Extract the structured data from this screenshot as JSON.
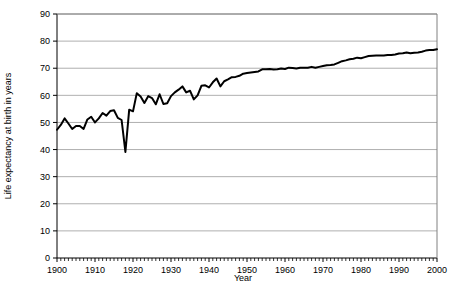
{
  "chart_data": {
    "type": "line",
    "title": "",
    "subtitle": "",
    "xlabel": "Year",
    "ylabel": "Life expectancy at birth in years",
    "xlim": [
      1900,
      2000
    ],
    "ylim": [
      0,
      90
    ],
    "ytick_labels": [
      "0",
      "10",
      "20",
      "30",
      "40",
      "50",
      "60",
      "70",
      "80",
      "90"
    ],
    "yticks": [
      0,
      10,
      20,
      30,
      40,
      50,
      60,
      70,
      80,
      90
    ],
    "xtick_labels": [
      "1900",
      "1910",
      "1920",
      "1930",
      "1940",
      "1950",
      "1960",
      "1970",
      "1980",
      "1990",
      "2000"
    ],
    "xticks": [
      1900,
      1910,
      1920,
      1930,
      1940,
      1950,
      1960,
      1970,
      1980,
      1990,
      2000
    ],
    "minor_xtick_interval": 1,
    "grid": "horizontal",
    "grid_color": "#9a9a9a",
    "legend": "none",
    "line_color": "#000000",
    "line_width": 2,
    "plot_border_color": "#808080",
    "background_color": "#ffffff",
    "x": [
      1900,
      1901,
      1902,
      1903,
      1904,
      1905,
      1906,
      1907,
      1908,
      1909,
      1910,
      1911,
      1912,
      1913,
      1914,
      1915,
      1916,
      1917,
      1918,
      1919,
      1920,
      1921,
      1922,
      1923,
      1924,
      1925,
      1926,
      1927,
      1928,
      1929,
      1930,
      1931,
      1932,
      1933,
      1934,
      1935,
      1936,
      1937,
      1938,
      1939,
      1940,
      1941,
      1942,
      1943,
      1944,
      1945,
      1946,
      1947,
      1948,
      1949,
      1950,
      1951,
      1952,
      1953,
      1954,
      1955,
      1956,
      1957,
      1958,
      1959,
      1960,
      1961,
      1962,
      1963,
      1964,
      1965,
      1966,
      1967,
      1968,
      1969,
      1970,
      1971,
      1972,
      1973,
      1974,
      1975,
      1976,
      1977,
      1978,
      1979,
      1980,
      1981,
      1982,
      1983,
      1984,
      1985,
      1986,
      1987,
      1988,
      1989,
      1990,
      1991,
      1992,
      1993,
      1994,
      1995,
      1996,
      1997,
      1998,
      1999,
      2000
    ],
    "values": [
      47.3,
      49.1,
      51.5,
      49.6,
      47.6,
      48.7,
      48.7,
      47.6,
      51.1,
      52.1,
      50.0,
      51.5,
      53.5,
      52.5,
      54.2,
      54.5,
      51.7,
      50.9,
      39.1,
      54.7,
      54.1,
      60.8,
      59.6,
      57.2,
      59.7,
      59.0,
      56.7,
      60.4,
      56.8,
      57.1,
      59.7,
      61.1,
      62.1,
      63.3,
      61.1,
      61.7,
      58.5,
      60.0,
      63.5,
      63.7,
      62.9,
      64.8,
      66.2,
      63.3,
      65.2,
      65.9,
      66.7,
      66.8,
      67.2,
      68.0,
      68.2,
      68.4,
      68.6,
      68.8,
      69.6,
      69.6,
      69.7,
      69.5,
      69.6,
      69.9,
      69.7,
      70.2,
      70.1,
      69.9,
      70.2,
      70.2,
      70.2,
      70.5,
      70.2,
      70.5,
      70.8,
      71.1,
      71.2,
      71.4,
      72.0,
      72.6,
      72.9,
      73.3,
      73.5,
      73.9,
      73.7,
      74.1,
      74.5,
      74.6,
      74.7,
      74.7,
      74.7,
      74.9,
      74.9,
      75.1,
      75.4,
      75.5,
      75.8,
      75.5,
      75.7,
      75.8,
      76.1,
      76.5,
      76.7,
      76.7,
      77.0
    ]
  }
}
